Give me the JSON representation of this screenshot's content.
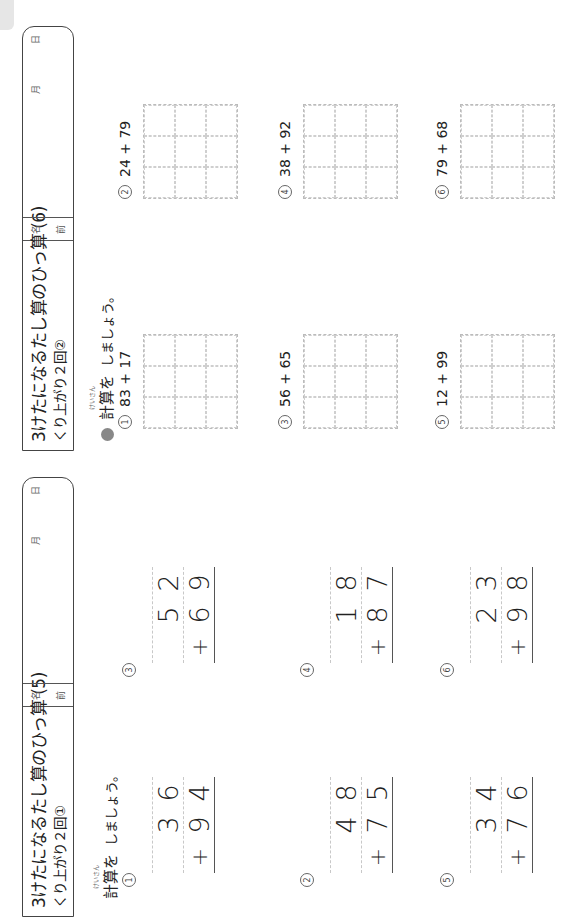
{
  "sheets": [
    {
      "id": "sheet5",
      "title": "3けたになるたし算のひっ算 (5)",
      "subtitle": "くり上がり２回①",
      "name_label_top": "名",
      "name_label_bottom": "前",
      "date_month": "月",
      "date_day": "日",
      "instruction_ruby": "けいさん",
      "instruction_word": "計算を",
      "instruction_rest": "しましょう。",
      "problems": [
        {
          "num": "1",
          "top": [
            "3",
            "6"
          ],
          "bottom": [
            "9",
            "4"
          ],
          "op": "+"
        },
        {
          "num": "2",
          "top": [
            "4",
            "8"
          ],
          "bottom": [
            "7",
            "5"
          ],
          "op": "+"
        },
        {
          "num": "3",
          "top": [
            "5",
            "2"
          ],
          "bottom": [
            "6",
            "9"
          ],
          "op": "+"
        },
        {
          "num": "4",
          "top": [
            "1",
            "8"
          ],
          "bottom": [
            "8",
            "7"
          ],
          "op": "+"
        },
        {
          "num": "5",
          "top": [
            "3",
            "4"
          ],
          "bottom": [
            "7",
            "6"
          ],
          "op": "+"
        },
        {
          "num": "6",
          "top": [
            "2",
            "3"
          ],
          "bottom": [
            "9",
            "8"
          ],
          "op": "+"
        }
      ]
    },
    {
      "id": "sheet6",
      "title": "3けたになるたし算のひっ算 (6)",
      "subtitle": "くり上がり２回②",
      "name_label_top": "名",
      "name_label_bottom": "前",
      "date_month": "月",
      "date_day": "日",
      "instruction_ruby": "けいさん",
      "instruction_word": "計算を",
      "instruction_rest": "しましょう。",
      "problems": [
        {
          "num": "1",
          "expr": "83 + 17"
        },
        {
          "num": "2",
          "expr": "24 + 79"
        },
        {
          "num": "3",
          "expr": "56 + 65"
        },
        {
          "num": "4",
          "expr": "38 + 92"
        },
        {
          "num": "5",
          "expr": "12 + 99"
        },
        {
          "num": "6",
          "expr": "79 + 68"
        }
      ]
    }
  ],
  "colors": {
    "bullet": "#888888",
    "grid_line": "#cfcfcf",
    "border": "#444444"
  }
}
